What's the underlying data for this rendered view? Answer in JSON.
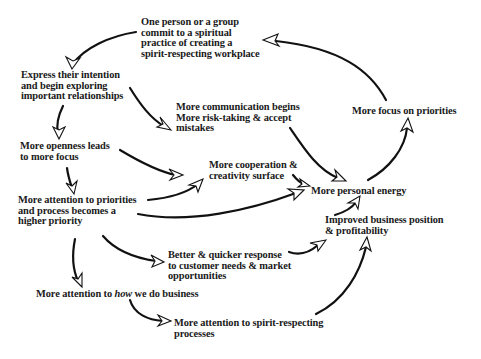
{
  "diagram": {
    "type": "cycle-flow",
    "nodes": [
      {
        "id": "commit",
        "lines": [
          "One person or a group",
          "commit to a spiritual",
          "practice of creating a",
          "spirit-respecting workplace"
        ]
      },
      {
        "id": "express",
        "lines": [
          "Express their intention",
          "and begin exploring",
          "important relationships"
        ]
      },
      {
        "id": "communication",
        "lines": [
          "More communication begins",
          "More risk-taking & accept",
          "mistakes"
        ]
      },
      {
        "id": "focus_priorities",
        "lines": [
          "More focus on priorities"
        ]
      },
      {
        "id": "openness",
        "lines": [
          "More openness leads",
          "to more focus"
        ]
      },
      {
        "id": "cooperation",
        "lines": [
          "More cooperation &",
          "creativity surface"
        ]
      },
      {
        "id": "energy",
        "lines": [
          "More personal energy"
        ]
      },
      {
        "id": "attention_priorities",
        "lines": [
          "More attention to priorities",
          "and process becomes a",
          "higher priority"
        ]
      },
      {
        "id": "business_position",
        "lines": [
          "Improved business position",
          "& profitability"
        ]
      },
      {
        "id": "response",
        "lines": [
          "Better & quicker response",
          "to customer needs & market",
          "opportunities"
        ]
      },
      {
        "id": "how_business",
        "lines": [
          "More attention to ",
          "how",
          " we do business"
        ]
      },
      {
        "id": "spirit_processes",
        "lines": [
          "More attention to spirit-respecting",
          "processes"
        ]
      }
    ],
    "edges": [
      {
        "from": "commit",
        "to": "express"
      },
      {
        "from": "express",
        "to": "communication"
      },
      {
        "from": "express",
        "to": "openness"
      },
      {
        "from": "communication",
        "to": "energy"
      },
      {
        "from": "openness",
        "to": "cooperation"
      },
      {
        "from": "openness",
        "to": "attention_priorities"
      },
      {
        "from": "attention_priorities",
        "to": "cooperation"
      },
      {
        "from": "attention_priorities",
        "to": "energy"
      },
      {
        "from": "attention_priorities",
        "to": "response"
      },
      {
        "from": "attention_priorities",
        "to": "how_business"
      },
      {
        "from": "cooperation",
        "to": "energy"
      },
      {
        "from": "energy",
        "to": "focus_priorities"
      },
      {
        "from": "focus_priorities",
        "to": "commit"
      },
      {
        "from": "business_position",
        "to": "energy"
      },
      {
        "from": "response",
        "to": "business_position"
      },
      {
        "from": "how_business",
        "to": "spirit_processes"
      },
      {
        "from": "spirit_processes",
        "to": "business_position"
      }
    ]
  }
}
